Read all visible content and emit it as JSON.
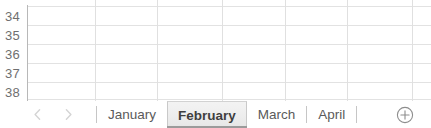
{
  "spreadsheet": {
    "row_headers": [
      "34",
      "35",
      "36",
      "37",
      "38"
    ],
    "row_header_partial_last": true,
    "columns_visible": 6,
    "cells_empty": true,
    "gridline_color": "#e2e2e2",
    "header_text_color": "#6f6f6f"
  },
  "sheet_tab_bar": {
    "nav": {
      "previous_label": "‹",
      "next_label": "›",
      "previous_name": "previous-sheet-arrow",
      "next_name": "next-sheet-arrow",
      "state": "disabled"
    },
    "tabs": [
      {
        "label": "January",
        "active": false
      },
      {
        "label": "February",
        "active": true
      },
      {
        "label": "March",
        "active": false
      },
      {
        "label": "April",
        "active": false
      }
    ],
    "active_tab": "February",
    "add_sheet": {
      "label": "+",
      "icon": "circle-plus-icon",
      "tooltip": "New sheet"
    },
    "active_tab_underline_color": "#9b9b9b",
    "tab_text_color": "#5a5a5a",
    "active_tab_text_color": "#3f3f3f"
  }
}
